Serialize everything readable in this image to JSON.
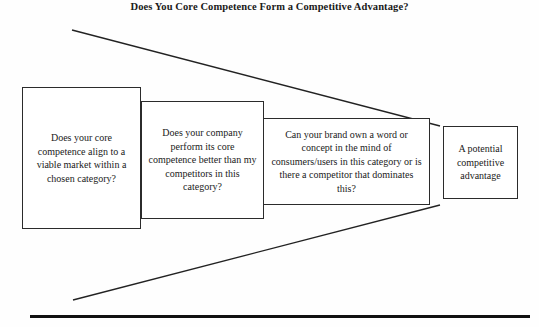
{
  "diagram": {
    "title": "Does You Core Competence Form a Competitive Advantage?",
    "type": "funnel",
    "stages": [
      {
        "index": 1,
        "name": "viable-market-question",
        "text": "Does your core competence align to a viable market within a chosen category?"
      },
      {
        "index": 2,
        "name": "better-than-competitors-question",
        "text": "Does your company perform its core competence better than my competitors in this category?"
      },
      {
        "index": 3,
        "name": "brand-ownership-question",
        "text": "Can your brand own a word or concept in the mind of consumers/users in this category or is there a competitor that dominates this?"
      },
      {
        "index": 4,
        "name": "outcome-result",
        "text": "A potential competitive advantage"
      }
    ],
    "colors": {
      "background": "#fefefe",
      "box_border": "#2b2b2b",
      "box_fill": "#ffffff",
      "funnel_line": "#222222",
      "baseline_rule": "#111111",
      "text": "#1a1a1a"
    }
  }
}
